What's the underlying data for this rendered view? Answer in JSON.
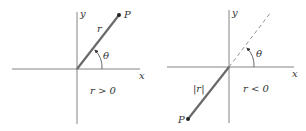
{
  "diagrams": [
    {
      "name": "positive-r",
      "axis_x_label": "x",
      "axis_y_label": "y",
      "point_label": "P",
      "radius_label": "r",
      "angle_label": "θ",
      "condition": "r > 0"
    },
    {
      "name": "negative-r",
      "axis_x_label": "x",
      "axis_y_label": "y",
      "point_label": "P",
      "radius_label": "|r|",
      "angle_label": "θ",
      "condition": "r < 0"
    }
  ],
  "colors": {
    "axis": "#555555",
    "radius_line": "#666666",
    "text": "#333333"
  }
}
